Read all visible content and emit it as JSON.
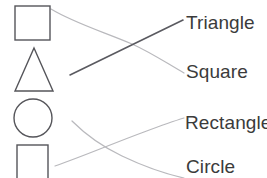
{
  "worksheet": {
    "type": "shape-matching-exercise",
    "background_color": "#ffffff",
    "width": 267,
    "height": 178,
    "shapes": [
      {
        "id": "shape-square-top",
        "name": "square",
        "geometry": {
          "x": 15,
          "y": 6,
          "width": 35,
          "height": 34
        },
        "stroke_color": "#55555a",
        "stroke_width": 1.4,
        "fill": "none"
      },
      {
        "id": "shape-triangle",
        "name": "triangle",
        "geometry": {
          "apex_x": 34,
          "apex_y": 48,
          "left_x": 15,
          "right_x": 53,
          "base_y": 91
        },
        "stroke_color": "#55555a",
        "stroke_width": 1.4,
        "fill": "none"
      },
      {
        "id": "shape-circle",
        "name": "circle",
        "geometry": {
          "cx": 33,
          "cy": 118,
          "r": 19
        },
        "stroke_color": "#55555a",
        "stroke_width": 1.4,
        "fill": "none"
      },
      {
        "id": "shape-rectangle-bottom",
        "name": "rectangle",
        "geometry": {
          "x": 17,
          "y": 145,
          "width": 31,
          "height": 42
        },
        "stroke_color": "#55555a",
        "stroke_width": 1.4,
        "fill": "none"
      }
    ],
    "labels": [
      {
        "id": "label-triangle",
        "text": "Triangle",
        "x": 186,
        "y": 13,
        "color": "#3b3b3b"
      },
      {
        "id": "label-square",
        "text": "Square",
        "x": 186,
        "y": 62,
        "color": "#3b3b3b"
      },
      {
        "id": "label-rectangle",
        "text": "Rectangle",
        "x": 185,
        "y": 113,
        "color": "#3b3b3b"
      },
      {
        "id": "label-circle",
        "text": "Circle",
        "x": 186,
        "y": 157,
        "color": "#3b3b3b"
      }
    ],
    "connector_lines": [
      {
        "id": "connector-square-to-square",
        "from_shape": "square",
        "to_label": "Square",
        "stroke_color": "#b9b9bd",
        "stroke_width": 1.2,
        "path": "M51,9 C74,23 104,32 132,44 C152,53 168,64 184,73"
      },
      {
        "id": "connector-triangle-to-triangle",
        "from_shape": "triangle",
        "to_label": "Triangle",
        "stroke_color": "#5a5a60",
        "stroke_width": 1.6,
        "path": "M70,75 L183,20"
      },
      {
        "id": "connector-circle-to-circle",
        "from_shape": "circle",
        "to_label": "Circle",
        "stroke_color": "#b9b9bd",
        "stroke_width": 1.2,
        "path": "M72,121 C84,133 101,146 122,156 C145,167 166,174 184,178"
      },
      {
        "id": "connector-rectangle-to-rectangle",
        "from_shape": "rectangle",
        "to_label": "Rectangle",
        "stroke_color": "#b9b9bd",
        "stroke_width": 1.2,
        "path": "M55,166 C84,156 114,143 144,132 C160,126 174,121 184,118"
      }
    ]
  }
}
